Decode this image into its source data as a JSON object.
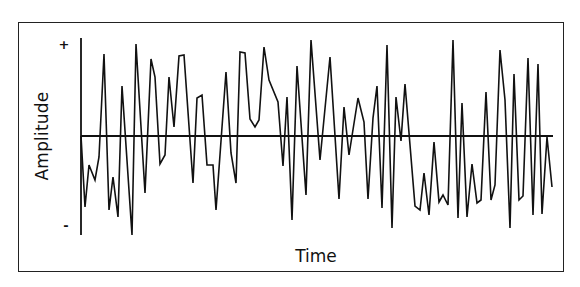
{
  "chart_data": {
    "type": "line",
    "title": "",
    "xlabel": "Time",
    "ylabel": "Amplitude",
    "ytick_labels": {
      "top": "+",
      "bottom": "-"
    },
    "grid": false,
    "legend": null,
    "axis": {
      "x": 81,
      "y_top": 38,
      "y_bottom": 235,
      "zero_y": 136,
      "zero_x_end": 553
    },
    "line_color": "#111111",
    "points": [
      [
        81,
        136
      ],
      [
        85,
        207
      ],
      [
        89,
        165
      ],
      [
        95,
        180
      ],
      [
        99,
        157
      ],
      [
        104,
        54
      ],
      [
        109,
        210
      ],
      [
        113,
        177
      ],
      [
        118,
        217
      ],
      [
        122,
        86
      ],
      [
        132,
        235
      ],
      [
        136,
        44
      ],
      [
        145,
        193
      ],
      [
        151,
        59
      ],
      [
        155,
        77
      ],
      [
        160,
        164
      ],
      [
        165,
        155
      ],
      [
        169,
        77
      ],
      [
        174,
        127
      ],
      [
        179,
        56
      ],
      [
        184,
        55
      ],
      [
        193,
        183
      ],
      [
        197,
        98
      ],
      [
        202,
        95
      ],
      [
        207,
        165
      ],
      [
        213,
        165
      ],
      [
        216,
        210
      ],
      [
        226,
        72
      ],
      [
        231,
        153
      ],
      [
        236,
        183
      ],
      [
        240,
        52
      ],
      [
        245,
        53
      ],
      [
        250,
        119
      ],
      [
        255,
        127
      ],
      [
        259,
        120
      ],
      [
        264,
        47
      ],
      [
        269,
        80
      ],
      [
        278,
        102
      ],
      [
        283,
        166
      ],
      [
        287,
        97
      ],
      [
        292,
        220
      ],
      [
        297,
        66
      ],
      [
        306,
        195
      ],
      [
        311,
        40
      ],
      [
        320,
        160
      ],
      [
        330,
        57
      ],
      [
        339,
        199
      ],
      [
        344,
        107
      ],
      [
        349,
        155
      ],
      [
        358,
        98
      ],
      [
        364,
        122
      ],
      [
        368,
        199
      ],
      [
        373,
        118
      ],
      [
        377,
        86
      ],
      [
        382,
        208
      ],
      [
        387,
        45
      ],
      [
        392,
        228
      ],
      [
        396,
        97
      ],
      [
        401,
        141
      ],
      [
        405,
        84
      ],
      [
        415,
        206
      ],
      [
        420,
        210
      ],
      [
        424,
        173
      ],
      [
        429,
        215
      ],
      [
        434,
        142
      ],
      [
        439,
        202
      ],
      [
        443,
        195
      ],
      [
        448,
        205
      ],
      [
        453,
        40
      ],
      [
        458,
        218
      ],
      [
        462,
        103
      ],
      [
        467,
        217
      ],
      [
        472,
        164
      ],
      [
        477,
        203
      ],
      [
        481,
        200
      ],
      [
        486,
        92
      ],
      [
        491,
        200
      ],
      [
        495,
        185
      ],
      [
        500,
        50
      ],
      [
        505,
        100
      ],
      [
        510,
        228
      ],
      [
        514,
        74
      ],
      [
        519,
        200
      ],
      [
        523,
        196
      ],
      [
        528,
        58
      ],
      [
        533,
        215
      ],
      [
        538,
        64
      ],
      [
        542,
        214
      ],
      [
        547,
        137
      ],
      [
        552,
        187
      ]
    ]
  }
}
